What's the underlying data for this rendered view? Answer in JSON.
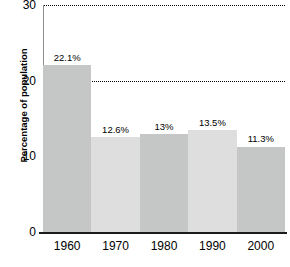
{
  "chart_data": {
    "type": "bar",
    "title": "",
    "subtitle": "",
    "xlabel": "",
    "ylabel": "Percentage of population",
    "categories": [
      "1960",
      "1970",
      "1980",
      "1990",
      "2000"
    ],
    "values": [
      22.1,
      12.6,
      13,
      13.5,
      11.3
    ],
    "data_labels": [
      "22.1%",
      "12.6%",
      "13%",
      "13.5%",
      "11.3%"
    ],
    "ylim": [
      0,
      30
    ],
    "yticks": [
      0,
      10,
      20,
      30
    ],
    "ytick_labels": [
      "0",
      "10",
      "20",
      "30"
    ],
    "grid": true,
    "grid_style": "dotted-horizontal",
    "legend": null,
    "legend_position": "none",
    "series": [
      {
        "name": "Percentage of population",
        "values": [
          22.1,
          12.6,
          13,
          13.5,
          11.3
        ]
      }
    ],
    "bar_colors": [
      "#c5c6c6",
      "#dddedd",
      "#c5c6c6",
      "#dddedd",
      "#c5c6c6"
    ],
    "colors": {
      "grid": "#000000",
      "axis_baseline": "#1b1b1b",
      "axis_spine": "#8d8d8d",
      "text": "#000000",
      "background": "#ffffff",
      "bar_dark": "#c5c6c6",
      "bar_light": "#dddedd"
    }
  }
}
